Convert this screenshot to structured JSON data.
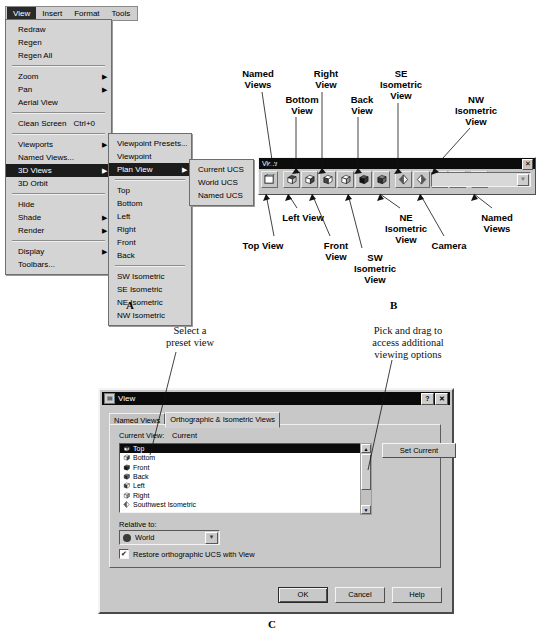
{
  "figure_a": {
    "label": "A",
    "menubar": {
      "items": [
        {
          "label": "View",
          "selected": true
        },
        {
          "label": "Insert",
          "selected": false
        },
        {
          "label": "Format",
          "selected": false
        },
        {
          "label": "Tools",
          "selected": false
        }
      ]
    },
    "view_menu": {
      "items": [
        {
          "label": "Redraw",
          "arrow": "",
          "accel": ""
        },
        {
          "label": "Regen",
          "arrow": "",
          "accel": ""
        },
        {
          "label": "Regen All",
          "arrow": "",
          "accel": ""
        },
        {
          "separator": true
        },
        {
          "label": "Zoom",
          "arrow": "▶",
          "accel": ""
        },
        {
          "label": "Pan",
          "arrow": "▶",
          "accel": ""
        },
        {
          "label": "Aerial View",
          "arrow": "",
          "accel": ""
        },
        {
          "separator": true
        },
        {
          "label": "Clean Screen",
          "arrow": "",
          "accel": "Ctrl+0"
        },
        {
          "separator": true
        },
        {
          "label": "Viewports",
          "arrow": "▶",
          "accel": ""
        },
        {
          "label": "Named Views...",
          "arrow": "",
          "accel": ""
        },
        {
          "label": "3D Views",
          "arrow": "▶",
          "accel": "",
          "highlighted": true
        },
        {
          "label": "3D Orbit",
          "arrow": "",
          "accel": ""
        },
        {
          "separator": true
        },
        {
          "label": "Hide",
          "arrow": "",
          "accel": ""
        },
        {
          "label": "Shade",
          "arrow": "▶",
          "accel": ""
        },
        {
          "label": "Render",
          "arrow": "▶",
          "accel": ""
        },
        {
          "separator": true
        },
        {
          "label": "Display",
          "arrow": "▶",
          "accel": ""
        },
        {
          "label": "Toolbars...",
          "arrow": "",
          "accel": ""
        }
      ]
    },
    "views_3d_submenu": {
      "items": [
        {
          "label": "Viewpoint Presets...",
          "arrow": "",
          "accel": ""
        },
        {
          "label": "Viewpoint",
          "arrow": "",
          "accel": ""
        },
        {
          "label": "Plan View",
          "arrow": "▶",
          "accel": "",
          "highlighted": true
        },
        {
          "separator": true
        },
        {
          "label": "Top",
          "arrow": "",
          "accel": ""
        },
        {
          "label": "Bottom",
          "arrow": "",
          "accel": ""
        },
        {
          "label": "Left",
          "arrow": "",
          "accel": ""
        },
        {
          "label": "Right",
          "arrow": "",
          "accel": ""
        },
        {
          "label": "Front",
          "arrow": "",
          "accel": ""
        },
        {
          "label": "Back",
          "arrow": "",
          "accel": ""
        },
        {
          "separator": true
        },
        {
          "label": "SW Isometric",
          "arrow": "",
          "accel": ""
        },
        {
          "label": "SE Isometric",
          "arrow": "",
          "accel": ""
        },
        {
          "label": "NE Isometric",
          "arrow": "",
          "accel": ""
        },
        {
          "label": "NW Isometric",
          "arrow": "",
          "accel": ""
        }
      ]
    },
    "plan_view_submenu": {
      "items": [
        {
          "label": "Current UCS",
          "arrow": "",
          "accel": ""
        },
        {
          "label": "World UCS",
          "arrow": "",
          "accel": ""
        },
        {
          "label": "Named UCS",
          "arrow": "",
          "accel": ""
        }
      ]
    }
  },
  "figure_b": {
    "label": "B",
    "toolbar": {
      "title": "View",
      "close_label": "✕",
      "buttons": [
        {
          "name": "named-views",
          "icon": "named-views-icon"
        },
        {
          "name": "top-view",
          "icon": "top-view-icon"
        },
        {
          "name": "bottom-view",
          "icon": "bottom-view-icon"
        },
        {
          "name": "left-view",
          "icon": "left-view-icon"
        },
        {
          "name": "right-view",
          "icon": "right-view-icon"
        },
        {
          "name": "front-view",
          "icon": "front-view-icon"
        },
        {
          "name": "back-view",
          "icon": "back-view-icon"
        },
        {
          "name": "sw-isometric-view",
          "icon": "sw-isometric-icon"
        },
        {
          "name": "se-isometric-view",
          "icon": "se-isometric-icon"
        },
        {
          "name": "ne-isometric-view",
          "icon": "ne-isometric-icon"
        },
        {
          "name": "nw-isometric-view",
          "icon": "nw-isometric-icon"
        },
        {
          "name": "camera",
          "icon": "camera-icon"
        }
      ],
      "combo_value": "",
      "combo_arrow": "▼"
    },
    "callouts_top": [
      {
        "text": "Named\nViews"
      },
      {
        "text": "Bottom\nView"
      },
      {
        "text": "Right\nView"
      },
      {
        "text": "Back\nView"
      },
      {
        "text": "SE\nIsometric\nView"
      },
      {
        "text": "NW\nIsometric\nView"
      }
    ],
    "callouts_bottom": [
      {
        "text": "Top View"
      },
      {
        "text": "Left View"
      },
      {
        "text": "Front\nView"
      },
      {
        "text": "SW\nIsometric\nView"
      },
      {
        "text": "NE\nIsometric\nView"
      },
      {
        "text": "Camera"
      },
      {
        "text": "Named\nViews"
      }
    ]
  },
  "figure_c": {
    "label": "C",
    "annotations": {
      "left": "Select a\npreset view",
      "right": "Pick and drag to\naccess additional\nviewing options"
    },
    "dialog": {
      "title": "View",
      "help_button": "?",
      "close_button": "✕",
      "tabs": [
        {
          "label": "Named Views",
          "active": false
        },
        {
          "label": "Orthographic & Isometric Views",
          "active": true
        }
      ],
      "current_view_label": "Current View:",
      "current_view_value": "Current",
      "list_items": [
        {
          "label": "Top",
          "selected": true
        },
        {
          "label": "Bottom",
          "selected": false
        },
        {
          "label": "Front",
          "selected": false
        },
        {
          "label": "Back",
          "selected": false
        },
        {
          "label": "Left",
          "selected": false
        },
        {
          "label": "Right",
          "selected": false
        },
        {
          "label": "Southwest Isometric",
          "selected": false
        }
      ],
      "scroll_up": "▲",
      "scroll_down": "▼",
      "set_current_label": "Set Current",
      "relative_to_label": "Relative to:",
      "relative_to_value": "World",
      "relative_to_arrow": "▼",
      "restore_checkbox_label": "Restore orthographic UCS with View",
      "restore_checkbox_mark": "✔",
      "buttons": [
        {
          "label": "OK",
          "default": true
        },
        {
          "label": "Cancel",
          "default": false
        },
        {
          "label": "Help",
          "default": false
        }
      ]
    }
  }
}
